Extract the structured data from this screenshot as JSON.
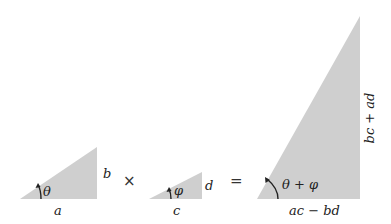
{
  "diagram": {
    "fill_color": "#cfcfcf",
    "text_color": "#222222",
    "operators": {
      "times": "×",
      "equals": "="
    },
    "triangles": [
      {
        "id": "triangle-1",
        "base_label": "a",
        "height_label": "b",
        "angle_label": "θ"
      },
      {
        "id": "triangle-2",
        "base_label": "c",
        "height_label": "d",
        "angle_label": "φ"
      },
      {
        "id": "triangle-product",
        "base_label": "ac − bd",
        "height_label": "bc + ad",
        "angle_label": "θ + φ"
      }
    ]
  }
}
